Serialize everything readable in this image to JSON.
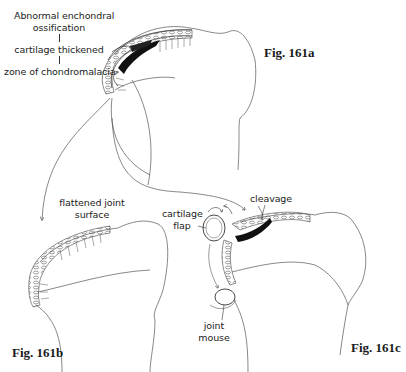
{
  "figures": [
    {
      "id": "161a",
      "caption": "Fig. 161a",
      "labels": {
        "line1": "Abnormal enchondral",
        "line2": "ossification",
        "line3": "cartilage thickened",
        "line4": "zone of chondromalacia"
      }
    },
    {
      "id": "161b",
      "caption": "Fig. 161b",
      "labels": {
        "line1": "flattened joint",
        "line2": "surface"
      }
    },
    {
      "id": "161c",
      "caption": "Fig. 161c",
      "labels": {
        "cleavage": "cleavage",
        "flap_line1": "cartilage",
        "flap_line2": "flap",
        "mouse_line1": "joint",
        "mouse_line2": "mouse"
      }
    }
  ],
  "colors": {
    "ink": "#333333",
    "background": "#ffffff"
  }
}
